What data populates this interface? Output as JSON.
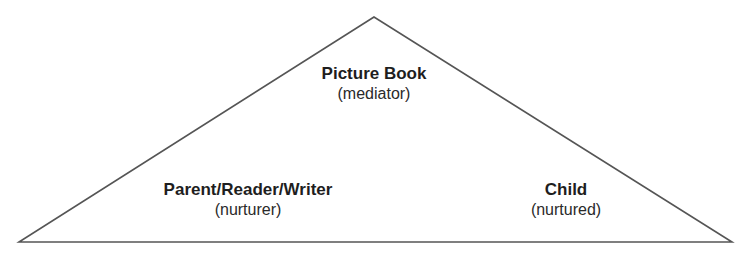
{
  "diagram": {
    "type": "triangle",
    "nodes": [
      {
        "id": "apex",
        "title": "Picture Book",
        "role": "(mediator)"
      },
      {
        "id": "left",
        "title": "Parent/Reader/Writer",
        "role": "(nurturer)"
      },
      {
        "id": "right",
        "title": "Child",
        "role": "(nurtured)"
      }
    ],
    "colors": {
      "stroke": "#555555",
      "text": "#1e1e1e"
    }
  }
}
